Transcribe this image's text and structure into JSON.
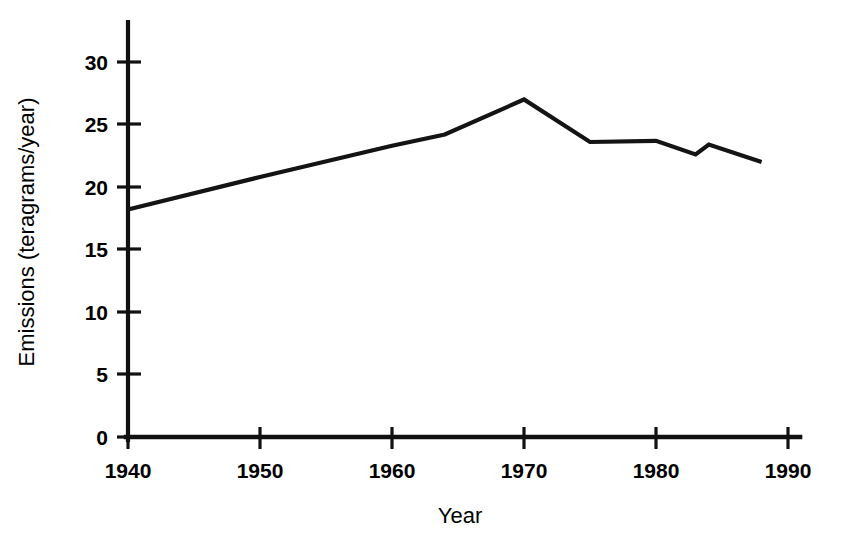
{
  "chart_data": {
    "type": "line",
    "title": "",
    "xlabel": "Year",
    "ylabel": "Emissions (teragrams/year)",
    "xlim": [
      1940,
      1990
    ],
    "ylim": [
      0,
      32
    ],
    "grid": false,
    "legend": "none",
    "x_ticks": [
      1940,
      1950,
      1960,
      1970,
      1980,
      1990
    ],
    "y_ticks": [
      0,
      5,
      10,
      15,
      20,
      25,
      30
    ],
    "x_tick_labels": [
      "1940",
      "1950",
      "1960",
      "1970",
      "1980",
      "1990"
    ],
    "y_tick_labels": [
      "0",
      "5",
      "10",
      "15",
      "20",
      "25",
      "30"
    ],
    "series": [
      {
        "name": "Emissions",
        "color": "#141414",
        "x": [
          1940,
          1950,
          1960,
          1964,
          1970,
          1975,
          1980,
          1983,
          1984,
          1988
        ],
        "values": [
          18.2,
          20.8,
          23.3,
          24.2,
          27.0,
          23.6,
          23.7,
          22.6,
          23.4,
          22.0
        ]
      }
    ]
  },
  "axes": {
    "y_axis_title": "Emissions (teragrams/year)",
    "x_axis_title": "Year"
  }
}
